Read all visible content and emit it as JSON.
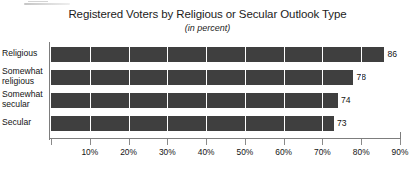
{
  "chart_data": {
    "type": "bar",
    "orientation": "horizontal",
    "title": "Registered Voters by Religious or Secular Outlook Type",
    "subtitle": "(in percent)",
    "xlabel": "",
    "ylabel": "",
    "categories": [
      "Religious",
      "Somewhat religious",
      "Somewhat secular",
      "Secular"
    ],
    "values": [
      86,
      78,
      74,
      73
    ],
    "value_labels": [
      "86",
      "78",
      "74",
      "73"
    ],
    "xlim": [
      0,
      90
    ],
    "xticks": [
      0,
      10,
      20,
      30,
      40,
      50,
      60,
      70,
      80,
      90
    ],
    "xtick_labels": [
      "",
      "10%",
      "20%",
      "30%",
      "40%",
      "50%",
      "60%",
      "70%",
      "80%",
      "90%"
    ],
    "grid": true,
    "grid_axis": "x",
    "grid_color": "#ffffff",
    "legend": false,
    "bar_color": "#3f3f3f",
    "axis_color": "#7d7d7d",
    "text_color": "#141414"
  },
  "categories_display": [
    {
      "line1": "Religious",
      "line2": ""
    },
    {
      "line1": "Somewhat",
      "line2": "religious"
    },
    {
      "line1": "Somewhat",
      "line2": "secular"
    },
    {
      "line1": "Secular",
      "line2": ""
    }
  ]
}
